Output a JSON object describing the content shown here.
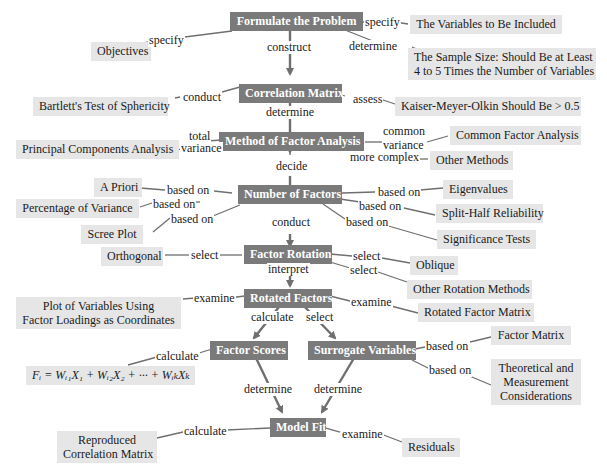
{
  "main_nodes": {
    "formulate": "Formulate the Problem",
    "correlation": "Correlation Matrix",
    "method": "Method of Factor Analysis",
    "number": "Number of Factors",
    "rotation": "Factor Rotation",
    "rotated": "Rotated Factors",
    "scores": "Factor Scores",
    "surrogate": "Surrogate Variables",
    "fit": "Model Fit"
  },
  "leaf_nodes": {
    "objectives": "Objectives",
    "variables": "The Variables to Be Included",
    "sample_1": "The Sample Size: Should Be at Least",
    "sample_2": "4 to 5 Times the Number of Variables",
    "bartlett": "Bartlett's Test of Sphericity",
    "kmo": "Kaiser-Meyer-Olkin Should Be > 0.5",
    "pca": "Principal Components Analysis",
    "cfa": "Common Factor Analysis",
    "other_methods": "Other Methods",
    "a_priori": "A Priori",
    "pct_variance": "Percentage of Variance",
    "scree": "Scree Plot",
    "eigen": "Eigenvalues",
    "split_half": "Split-Half Reliability",
    "sig_tests": "Significance Tests",
    "orthogonal": "Orthogonal",
    "oblique": "Oblique",
    "other_rotation": "Other Rotation Methods",
    "plot_1": "Plot of Variables Using",
    "plot_2": "Factor Loadings as Coordinates",
    "rotated_matrix": "Rotated Factor Matrix",
    "factor_matrix": "Factor Matrix",
    "theory_1": "Theoretical and",
    "theory_2": "Measurement",
    "theory_3": "Considerations",
    "formula": "Fᵢ = Wᵢ₁X₁ + Wᵢ₂X₂ + ··· + WᵢₖXₖ",
    "reproduced_1": "Reproduced",
    "reproduced_2": "Correlation Matrix",
    "residuals": "Residuals"
  },
  "edge_labels": {
    "specify_left": "specify",
    "specify_right": "specify",
    "construct": "construct",
    "determine_sample": "determine",
    "conduct_bartlett": "conduct",
    "determine_method": "determine",
    "assess": "assess",
    "total": "total",
    "variance_total": "variance",
    "common": "common",
    "variance_common": "variance",
    "more_complex": "more complex",
    "decide": "decide",
    "based_on_apriori": "based on",
    "based_on_pct": "based on",
    "based_on_scree": "based on",
    "based_on_eigen": "based on",
    "based_on_split": "based on",
    "based_on_sig": "based on",
    "conduct_rotation": "conduct",
    "select_orth": "select",
    "select_obl": "select",
    "select_other": "select",
    "interpret": "interpret",
    "examine_plot": "examine",
    "examine_rotated": "examine",
    "calculate_scores": "calculate",
    "select_surrogate": "select",
    "calculate_formula": "calculate",
    "based_on_fm": "based on",
    "based_on_theory": "based on",
    "determine_fit_left": "determine",
    "determine_fit_right": "determine",
    "calculate_reproduced": "calculate",
    "examine_residuals": "examine"
  },
  "colors": {
    "main_node_bg": "#7a7a7a",
    "leaf_node_bg": "#e6e6e6",
    "edge": "#6f6f6f"
  }
}
